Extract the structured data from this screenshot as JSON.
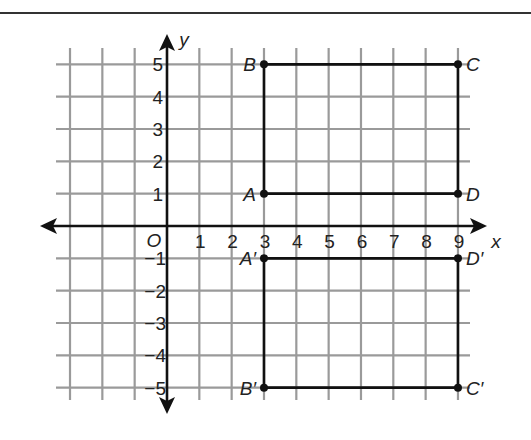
{
  "figure": {
    "x_axis_label": "x",
    "y_axis_label": "y",
    "origin_label": "O",
    "x_tick_labels": [
      "1",
      "2",
      "3",
      "4",
      "5",
      "6",
      "7",
      "8",
      "9"
    ],
    "y_tick_labels_positive": [
      "1",
      "2",
      "3",
      "4",
      "5"
    ],
    "y_tick_labels_negative": [
      "−1",
      "−2",
      "−3",
      "−4",
      "−5"
    ],
    "grid": {
      "x_min": -3,
      "x_max": 9,
      "y_min": -5,
      "y_max": 5
    },
    "colors": {
      "grid": "#9a9a9a",
      "axis": "#111111",
      "shape": "#111111",
      "text": "#222222"
    }
  },
  "chart_data": {
    "type": "scatter",
    "title": "",
    "xlabel": "x",
    "ylabel": "y",
    "xlim": [
      -3,
      9
    ],
    "ylim": [
      -5,
      5
    ],
    "grid": true,
    "series": [
      {
        "name": "Rectangle ABCD",
        "points": [
          {
            "label": "A",
            "x": 3,
            "y": 1
          },
          {
            "label": "B",
            "x": 3,
            "y": 5
          },
          {
            "label": "C",
            "x": 9,
            "y": 5
          },
          {
            "label": "D",
            "x": 9,
            "y": 1
          }
        ]
      },
      {
        "name": "Rectangle A'B'C'D'",
        "points": [
          {
            "label": "A′",
            "x": 3,
            "y": -1
          },
          {
            "label": "B′",
            "x": 3,
            "y": -5
          },
          {
            "label": "C′",
            "x": 9,
            "y": -5
          },
          {
            "label": "D′",
            "x": 9,
            "y": -1
          }
        ]
      }
    ]
  }
}
